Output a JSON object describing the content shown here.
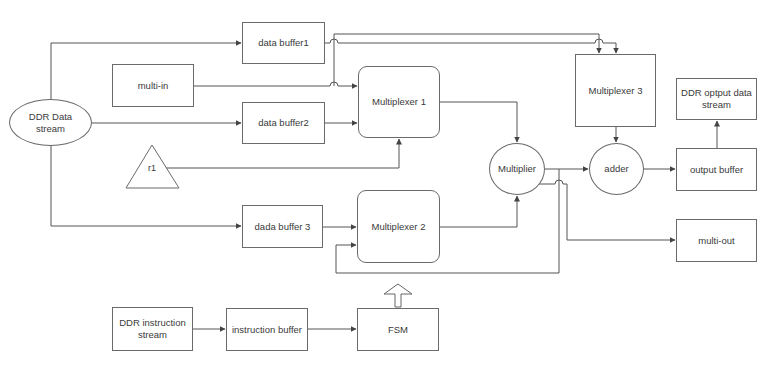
{
  "diagram": {
    "nodes": {
      "ddr_data_stream": {
        "label": "DDR Data stream",
        "shape": "ellipse"
      },
      "data_buffer1": {
        "label": "data buffer1",
        "shape": "rect"
      },
      "multi_in": {
        "label": "multi-in",
        "shape": "rect"
      },
      "data_buffer2": {
        "label": "data buffer2",
        "shape": "rect"
      },
      "r1": {
        "label": "r1",
        "shape": "triangle"
      },
      "dada_buffer3": {
        "label": "dada buffer 3",
        "shape": "rect"
      },
      "multiplexer1": {
        "label": "Multiplexer 1",
        "shape": "rounded-rect"
      },
      "multiplexer2": {
        "label": "Multiplexer 2",
        "shape": "rounded-rect"
      },
      "multiplexer3": {
        "label": "Multiplexer 3",
        "shape": "rect"
      },
      "multiplier": {
        "label": "Multiplier",
        "shape": "circle"
      },
      "adder": {
        "label": "adder",
        "shape": "circle"
      },
      "output_buffer": {
        "label": "output buffer",
        "shape": "rect"
      },
      "ddr_output_stream": {
        "label": "DDR optput data stream",
        "shape": "rect"
      },
      "multi_out": {
        "label": "multi-out",
        "shape": "rect"
      },
      "ddr_instruction_stream": {
        "label": "DDR instruction stream",
        "shape": "rect"
      },
      "instruction_buffer": {
        "label": "instruction buffer",
        "shape": "rect"
      },
      "fsm": {
        "label": "FSM",
        "shape": "rect"
      }
    },
    "edges": [
      {
        "from": "ddr_data_stream",
        "to": "data_buffer1"
      },
      {
        "from": "ddr_data_stream",
        "to": "data_buffer2"
      },
      {
        "from": "ddr_data_stream",
        "to": "dada_buffer3"
      },
      {
        "from": "multi_in",
        "to": "multiplexer1"
      },
      {
        "from": "multi_in",
        "to": "multiplexer3"
      },
      {
        "from": "data_buffer1",
        "to": "multiplexer3"
      },
      {
        "from": "data_buffer2",
        "to": "multiplexer1"
      },
      {
        "from": "r1",
        "to": "multiplexer1"
      },
      {
        "from": "dada_buffer3",
        "to": "multiplexer2"
      },
      {
        "from": "multiplexer1",
        "to": "multiplier"
      },
      {
        "from": "multiplexer2",
        "to": "multiplier"
      },
      {
        "from": "multiplier",
        "to": "adder"
      },
      {
        "from": "multiplier",
        "to": "multiplexer2"
      },
      {
        "from": "multiplier",
        "to": "multi_out"
      },
      {
        "from": "multiplexer3",
        "to": "adder"
      },
      {
        "from": "adder",
        "to": "output_buffer"
      },
      {
        "from": "output_buffer",
        "to": "ddr_output_stream"
      },
      {
        "from": "ddr_instruction_stream",
        "to": "instruction_buffer"
      },
      {
        "from": "instruction_buffer",
        "to": "fsm"
      },
      {
        "from": "fsm",
        "to": "multiplexer2",
        "style": "hollow-arrow"
      }
    ],
    "colors": {
      "line": "#555555",
      "border": "#6a6a6a",
      "text": "#3a3a3a",
      "background": "#ffffff"
    }
  }
}
